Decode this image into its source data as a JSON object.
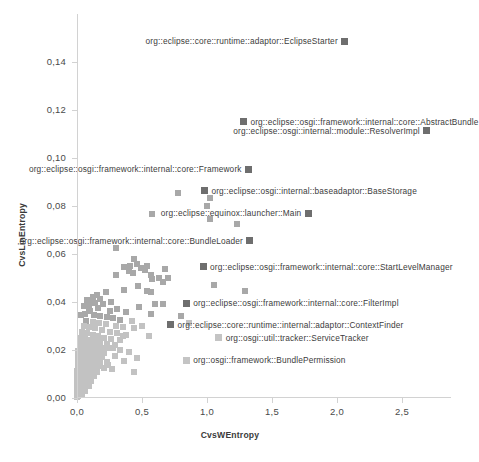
{
  "chart_data": {
    "type": "scatter",
    "title": "",
    "xlabel": "CvsWEntropy",
    "ylabel": "CvsLinEntropy",
    "xlim": [
      -0.12,
      2.88
    ],
    "ylim": [
      0.0,
      0.16
    ],
    "grid": false,
    "legend": "none",
    "xticks": [
      "0,0",
      "0,5",
      "1,0",
      "1,5",
      "2,0",
      "2,5"
    ],
    "xtick_values": [
      0.0,
      0.5,
      1.0,
      1.5,
      2.0,
      2.5
    ],
    "yticks": [
      "0,00",
      "0,02",
      "0,04",
      "0,06",
      "0,08",
      "0,10",
      "0,12",
      "0,14"
    ],
    "ytick_values": [
      0.0,
      0.02,
      0.04,
      0.06,
      0.08,
      0.1,
      0.12,
      0.14
    ],
    "marker_color": "#a8a8a8",
    "marker_color_dark": "#6e6e6e",
    "annotations": [
      {
        "text": "org::eclipse::core::runtime::adaptor::EclipseStarter",
        "x": 2.06,
        "y": 0.1485,
        "side": "right",
        "dark": true
      },
      {
        "text": "org::eclipse::osgi::framework::internal::core::AbstractBundle",
        "x": 1.28,
        "y": 0.1148,
        "side": "left",
        "dark": true
      },
      {
        "text": "org::eclipse::osgi::internal::module::ResolverImpl",
        "x": 2.69,
        "y": 0.1112,
        "side": "right",
        "dark": true
      },
      {
        "text": "org::eclipse::osgi::framework::internal::core::Framework",
        "x": 1.32,
        "y": 0.0952,
        "side": "right",
        "dark": true
      },
      {
        "text": "org::eclipse::osgi::internal::baseadaptor::BaseStorage",
        "x": 0.98,
        "y": 0.0862,
        "side": "left",
        "dark": true
      },
      {
        "text": "org::eclipse::equinox::launcher::Main",
        "x": 1.78,
        "y": 0.0767,
        "side": "right",
        "dark": true
      },
      {
        "text": "org::eclipse::osgi::framework::internal::core::BundleLoader",
        "x": 1.33,
        "y": 0.0653,
        "side": "right",
        "dark": true
      },
      {
        "text": "org::eclipse::osgi::framework::internal::core::StartLevelManager",
        "x": 0.97,
        "y": 0.0545,
        "side": "left",
        "dark": true
      },
      {
        "text": "org::eclipse::osgi::framework::internal::core::FilterImpl",
        "x": 0.84,
        "y": 0.0393,
        "side": "left",
        "dark": true
      },
      {
        "text": "org::eclipse::core::runtime::internal::adaptor::ContextFinder",
        "x": 0.72,
        "y": 0.0303,
        "side": "left",
        "dark": true
      },
      {
        "text": "org::osgi::util::tracker::ServiceTracker",
        "x": 1.09,
        "y": 0.025,
        "side": "left",
        "dark": false
      },
      {
        "text": "org::osgi::framework::BundlePermission",
        "x": 0.84,
        "y": 0.0155,
        "side": "left",
        "dark": false
      }
    ],
    "points": [
      [
        2.06,
        0.1485
      ],
      [
        1.28,
        0.1148
      ],
      [
        2.69,
        0.1112
      ],
      [
        1.32,
        0.0952
      ],
      [
        0.98,
        0.0862
      ],
      [
        1.78,
        0.0767
      ],
      [
        0.78,
        0.0854
      ],
      [
        1.02,
        0.0832
      ],
      [
        1.0,
        0.08
      ],
      [
        0.58,
        0.0765
      ],
      [
        1.02,
        0.0745
      ],
      [
        1.23,
        0.0722
      ],
      [
        1.33,
        0.0653
      ],
      [
        0.97,
        0.0545
      ],
      [
        0.84,
        0.0393
      ],
      [
        0.72,
        0.0303
      ],
      [
        1.09,
        0.025
      ],
      [
        0.84,
        0.0155
      ],
      [
        0.3,
        0.0624
      ],
      [
        0.44,
        0.0578
      ],
      [
        0.36,
        0.0545
      ],
      [
        0.41,
        0.0548
      ],
      [
        0.46,
        0.0556
      ],
      [
        0.54,
        0.0547
      ],
      [
        0.49,
        0.054
      ],
      [
        0.52,
        0.053
      ],
      [
        0.4,
        0.0528
      ],
      [
        0.43,
        0.052
      ],
      [
        0.3,
        0.051
      ],
      [
        0.57,
        0.051
      ],
      [
        0.68,
        0.0535
      ],
      [
        0.7,
        0.0498
      ],
      [
        0.63,
        0.05
      ],
      [
        0.58,
        0.0495
      ],
      [
        0.66,
        0.048
      ],
      [
        1.05,
        0.0468
      ],
      [
        1.29,
        0.0443
      ],
      [
        0.47,
        0.0463
      ],
      [
        0.36,
        0.0448
      ],
      [
        0.54,
        0.0443
      ],
      [
        0.57,
        0.044
      ],
      [
        0.22,
        0.044
      ],
      [
        0.15,
        0.0428
      ],
      [
        0.12,
        0.042
      ],
      [
        0.18,
        0.041
      ],
      [
        0.08,
        0.0408
      ],
      [
        0.1,
        0.04
      ],
      [
        0.14,
        0.0395
      ],
      [
        0.2,
        0.039
      ],
      [
        0.26,
        0.0398
      ],
      [
        0.6,
        0.039
      ],
      [
        0.66,
        0.0388
      ],
      [
        0.48,
        0.0378
      ],
      [
        0.31,
        0.0368
      ],
      [
        0.38,
        0.0355
      ],
      [
        0.57,
        0.035
      ],
      [
        0.1,
        0.036
      ],
      [
        0.06,
        0.035
      ],
      [
        0.13,
        0.0345
      ],
      [
        0.18,
        0.034
      ],
      [
        0.23,
        0.0335
      ],
      [
        0.28,
        0.033
      ],
      [
        0.33,
        0.0322
      ],
      [
        0.07,
        0.032
      ],
      [
        0.12,
        0.0315
      ],
      [
        0.17,
        0.031
      ],
      [
        0.22,
        0.0305
      ],
      [
        0.3,
        0.03
      ],
      [
        0.35,
        0.0292
      ],
      [
        0.44,
        0.0288
      ],
      [
        0.8,
        0.0338
      ],
      [
        0.86,
        0.0312
      ],
      [
        0.05,
        0.03
      ],
      [
        0.09,
        0.0292
      ],
      [
        0.14,
        0.0288
      ],
      [
        0.19,
        0.028
      ],
      [
        0.25,
        0.0275
      ],
      [
        0.31,
        0.0268
      ],
      [
        0.38,
        0.0262
      ],
      [
        0.04,
        0.0275
      ],
      [
        0.08,
        0.0268
      ],
      [
        0.12,
        0.0262
      ],
      [
        0.16,
        0.0255
      ],
      [
        0.21,
        0.025
      ],
      [
        0.26,
        0.0245
      ],
      [
        0.33,
        0.024
      ],
      [
        0.03,
        0.025
      ],
      [
        0.06,
        0.0245
      ],
      [
        0.1,
        0.024
      ],
      [
        0.14,
        0.0235
      ],
      [
        0.18,
        0.023
      ],
      [
        0.23,
        0.0225
      ],
      [
        0.29,
        0.022
      ],
      [
        0.02,
        0.023
      ],
      [
        0.05,
        0.0225
      ],
      [
        0.08,
        0.022
      ],
      [
        0.11,
        0.0215
      ],
      [
        0.15,
        0.0212
      ],
      [
        0.19,
        0.0208
      ],
      [
        0.24,
        0.0205
      ],
      [
        0.02,
        0.021
      ],
      [
        0.04,
        0.0205
      ],
      [
        0.07,
        0.02
      ],
      [
        0.1,
        0.0198
      ],
      [
        0.13,
        0.0195
      ],
      [
        0.17,
        0.019
      ],
      [
        0.21,
        0.0186
      ],
      [
        0.01,
        0.0192
      ],
      [
        0.03,
        0.0188
      ],
      [
        0.06,
        0.0184
      ],
      [
        0.09,
        0.018
      ],
      [
        0.12,
        0.0176
      ],
      [
        0.15,
        0.0172
      ],
      [
        0.19,
        0.0168
      ],
      [
        0.29,
        0.0175
      ],
      [
        0.01,
        0.0172
      ],
      [
        0.03,
        0.0168
      ],
      [
        0.05,
        0.0164
      ],
      [
        0.08,
        0.016
      ],
      [
        0.11,
        0.0156
      ],
      [
        0.14,
        0.0152
      ],
      [
        0.18,
        0.0148
      ],
      [
        0.23,
        0.0148
      ],
      [
        0.36,
        0.0152
      ],
      [
        0.01,
        0.0152
      ],
      [
        0.02,
        0.0148
      ],
      [
        0.04,
        0.0144
      ],
      [
        0.07,
        0.014
      ],
      [
        0.1,
        0.0136
      ],
      [
        0.13,
        0.0132
      ],
      [
        0.16,
        0.013
      ],
      [
        0.24,
        0.0136
      ],
      [
        0.44,
        0.0108
      ],
      [
        0.01,
        0.0132
      ],
      [
        0.02,
        0.0128
      ],
      [
        0.04,
        0.0124
      ],
      [
        0.06,
        0.012
      ],
      [
        0.09,
        0.0116
      ],
      [
        0.12,
        0.0112
      ],
      [
        0.15,
        0.0108
      ],
      [
        0.0,
        0.0112
      ],
      [
        0.02,
        0.0108
      ],
      [
        0.03,
        0.0104
      ],
      [
        0.05,
        0.01
      ],
      [
        0.07,
        0.0096
      ],
      [
        0.1,
        0.0092
      ],
      [
        0.13,
        0.0088
      ],
      [
        0.0,
        0.0092
      ],
      [
        0.01,
        0.0088
      ],
      [
        0.03,
        0.0084
      ],
      [
        0.04,
        0.008
      ],
      [
        0.06,
        0.0076
      ],
      [
        0.08,
        0.0072
      ],
      [
        0.11,
        0.0068
      ],
      [
        0.0,
        0.007
      ],
      [
        0.01,
        0.0066
      ],
      [
        0.02,
        0.0062
      ],
      [
        0.04,
        0.0058
      ],
      [
        0.05,
        0.0054
      ],
      [
        0.07,
        0.005
      ],
      [
        0.09,
        0.0046
      ],
      [
        0.0,
        0.0048
      ],
      [
        0.01,
        0.0044
      ],
      [
        0.02,
        0.004
      ],
      [
        0.03,
        0.0036
      ],
      [
        0.05,
        0.0032
      ],
      [
        0.06,
        0.0028
      ],
      [
        0.0,
        0.0026
      ],
      [
        0.01,
        0.0022
      ],
      [
        0.02,
        0.0018
      ],
      [
        0.03,
        0.0014
      ],
      [
        0.04,
        0.001
      ],
      [
        0.01,
        0.0006
      ],
      [
        0.0,
        0.0004
      ],
      [
        0.17,
        0.014
      ],
      [
        0.21,
        0.0125
      ],
      [
        0.27,
        0.0118
      ],
      [
        0.05,
        0.038
      ],
      [
        0.09,
        0.0372
      ],
      [
        0.03,
        0.0342
      ],
      [
        0.16,
        0.0372
      ],
      [
        0.25,
        0.036
      ],
      [
        0.42,
        0.0318
      ],
      [
        0.5,
        0.03
      ],
      [
        0.55,
        0.0255
      ],
      [
        0.35,
        0.0255
      ],
      [
        0.28,
        0.0208
      ],
      [
        0.33,
        0.02
      ],
      [
        0.4,
        0.0188
      ],
      [
        0.46,
        0.0165
      ]
    ]
  }
}
